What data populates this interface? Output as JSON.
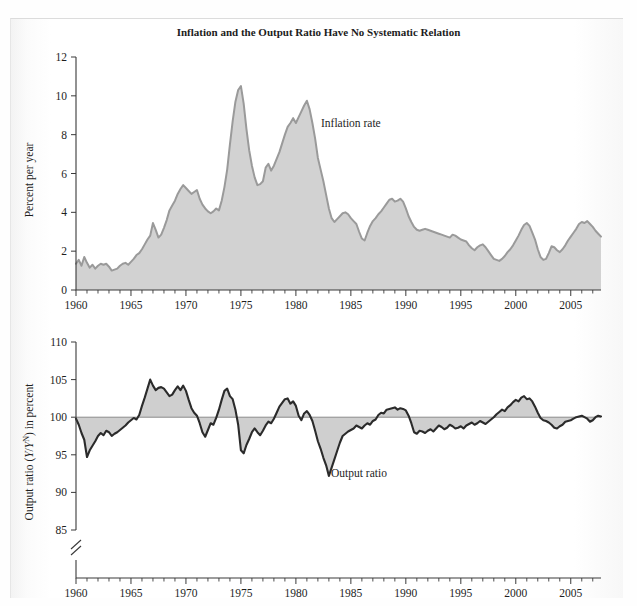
{
  "figure": {
    "title": "Inflation and the Output Ratio Have No Systematic Relation",
    "background_color": "#ffffff",
    "fill_color": "#d2d2d2",
    "inflation_line_color": "#9a9a9a",
    "output_line_color": "#2b2b2b"
  },
  "labels": {
    "inflation_annotation": "Inflation rate",
    "output_annotation": "Output ratio",
    "top_ylabel": "Percent per year",
    "bottom_ylabel_pre": "Output ratio (",
    "bottom_ylabel_y1": "Y",
    "bottom_ylabel_slash": "/",
    "bottom_ylabel_y2": "Y",
    "bottom_ylabel_sup": "N",
    "bottom_ylabel_post": ") in percent"
  },
  "axes": {
    "x_tick_labels": [
      "1960",
      "1965",
      "1970",
      "1975",
      "1980",
      "1985",
      "1990",
      "1995",
      "2000",
      "2005"
    ],
    "x_tick_values": [
      1960,
      1965,
      1970,
      1975,
      1980,
      1985,
      1990,
      1995,
      2000,
      2005
    ],
    "x_min": 1960,
    "x_max": 2007.75,
    "x_minor_step": 1,
    "top_y_tick_labels": [
      "0",
      "2",
      "4",
      "6",
      "8",
      "10",
      "12"
    ],
    "top_y_tick_values": [
      0,
      2,
      4,
      6,
      8,
      10,
      12
    ],
    "top_y_min": 0,
    "top_y_max": 12,
    "bottom_y_tick_labels": [
      "85",
      "90",
      "95",
      "100",
      "105",
      "110"
    ],
    "bottom_y_tick_values": [
      85,
      90,
      95,
      100,
      105,
      110
    ],
    "bottom_y_min": 85,
    "bottom_y_max": 110,
    "bottom_axis_break": true,
    "grid": false,
    "legend": "inline annotations"
  },
  "chart_data": [
    {
      "type": "area",
      "id": "inflation-rate",
      "title": "Inflation and the Output Ratio Have No Systematic Relation",
      "name": "Inflation rate",
      "xlabel": "",
      "ylabel": "Percent per year",
      "xlim": [
        1960,
        2007.75
      ],
      "ylim": [
        0,
        12
      ],
      "grid": false,
      "units": "percent per year",
      "x": [
        1960.0,
        1960.25,
        1960.5,
        1960.75,
        1961.0,
        1961.25,
        1961.5,
        1961.75,
        1962.0,
        1962.25,
        1962.5,
        1962.75,
        1963.0,
        1963.25,
        1963.5,
        1963.75,
        1964.0,
        1964.25,
        1964.5,
        1964.75,
        1965.0,
        1965.25,
        1965.5,
        1965.75,
        1966.0,
        1966.25,
        1966.5,
        1966.75,
        1967.0,
        1967.25,
        1967.5,
        1967.75,
        1968.0,
        1968.25,
        1968.5,
        1968.75,
        1969.0,
        1969.25,
        1969.5,
        1969.75,
        1970.0,
        1970.25,
        1970.5,
        1970.75,
        1971.0,
        1971.25,
        1971.5,
        1971.75,
        1972.0,
        1972.25,
        1972.5,
        1972.75,
        1973.0,
        1973.25,
        1973.5,
        1973.75,
        1974.0,
        1974.25,
        1974.5,
        1974.75,
        1975.0,
        1975.25,
        1975.5,
        1975.75,
        1976.0,
        1976.25,
        1976.5,
        1976.75,
        1977.0,
        1977.25,
        1977.5,
        1977.75,
        1978.0,
        1978.25,
        1978.5,
        1978.75,
        1979.0,
        1979.25,
        1979.5,
        1979.75,
        1980.0,
        1980.25,
        1980.5,
        1980.75,
        1981.0,
        1981.25,
        1981.5,
        1981.75,
        1982.0,
        1982.25,
        1982.5,
        1982.75,
        1983.0,
        1983.25,
        1983.5,
        1983.75,
        1984.0,
        1984.25,
        1984.5,
        1984.75,
        1985.0,
        1985.25,
        1985.5,
        1985.75,
        1986.0,
        1986.25,
        1986.5,
        1986.75,
        1987.0,
        1987.25,
        1987.5,
        1987.75,
        1988.0,
        1988.25,
        1988.5,
        1988.75,
        1989.0,
        1989.25,
        1989.5,
        1989.75,
        1990.0,
        1990.25,
        1990.5,
        1990.75,
        1991.0,
        1991.25,
        1991.5,
        1991.75,
        1992.0,
        1992.25,
        1992.5,
        1992.75,
        1993.0,
        1993.25,
        1993.5,
        1993.75,
        1994.0,
        1994.25,
        1994.5,
        1994.75,
        1995.0,
        1995.25,
        1995.5,
        1995.75,
        1996.0,
        1996.25,
        1996.5,
        1996.75,
        1997.0,
        1997.25,
        1997.5,
        1997.75,
        1998.0,
        1998.25,
        1998.5,
        1998.75,
        1999.0,
        1999.25,
        1999.5,
        1999.75,
        2000.0,
        2000.25,
        2000.5,
        2000.75,
        2001.0,
        2001.25,
        2001.5,
        2001.75,
        2002.0,
        2002.25,
        2002.5,
        2002.75,
        2003.0,
        2003.25,
        2003.5,
        2003.75,
        2004.0,
        2004.25,
        2004.5,
        2004.75,
        2005.0,
        2005.25,
        2005.5,
        2005.75,
        2006.0,
        2006.25,
        2006.5,
        2006.75,
        2007.0,
        2007.25,
        2007.5,
        2007.75
      ],
      "values": [
        1.35,
        1.55,
        1.25,
        1.7,
        1.4,
        1.15,
        1.3,
        1.1,
        1.25,
        1.35,
        1.3,
        1.35,
        1.2,
        1.0,
        1.05,
        1.1,
        1.25,
        1.35,
        1.4,
        1.3,
        1.45,
        1.6,
        1.8,
        1.9,
        2.1,
        2.35,
        2.6,
        2.8,
        3.45,
        3.1,
        2.7,
        2.85,
        3.2,
        3.6,
        4.1,
        4.35,
        4.6,
        4.95,
        5.2,
        5.4,
        5.25,
        5.1,
        4.95,
        5.05,
        5.15,
        4.7,
        4.4,
        4.2,
        4.05,
        3.95,
        4.05,
        4.2,
        4.1,
        4.6,
        5.3,
        6.2,
        7.5,
        8.7,
        9.7,
        10.3,
        10.5,
        9.6,
        8.3,
        7.2,
        6.4,
        5.8,
        5.4,
        5.45,
        5.6,
        6.3,
        6.5,
        6.15,
        6.4,
        6.75,
        7.1,
        7.55,
        8.0,
        8.4,
        8.6,
        8.85,
        8.6,
        8.9,
        9.2,
        9.5,
        9.75,
        9.3,
        8.6,
        7.8,
        6.8,
        6.2,
        5.6,
        4.9,
        4.2,
        3.7,
        3.5,
        3.65,
        3.8,
        3.95,
        4.0,
        3.9,
        3.7,
        3.55,
        3.4,
        3.0,
        2.65,
        2.55,
        2.95,
        3.3,
        3.55,
        3.7,
        3.9,
        4.05,
        4.25,
        4.45,
        4.65,
        4.7,
        4.55,
        4.6,
        4.7,
        4.55,
        4.2,
        3.8,
        3.5,
        3.25,
        3.1,
        3.05,
        3.1,
        3.15,
        3.1,
        3.05,
        3.0,
        2.95,
        2.9,
        2.85,
        2.8,
        2.75,
        2.7,
        2.85,
        2.8,
        2.7,
        2.6,
        2.55,
        2.5,
        2.3,
        2.15,
        2.05,
        2.2,
        2.3,
        2.35,
        2.2,
        2.0,
        1.8,
        1.6,
        1.55,
        1.5,
        1.6,
        1.75,
        1.95,
        2.1,
        2.3,
        2.55,
        2.8,
        3.1,
        3.35,
        3.45,
        3.3,
        2.95,
        2.6,
        2.1,
        1.7,
        1.55,
        1.6,
        1.9,
        2.25,
        2.2,
        2.05,
        1.95,
        2.1,
        2.3,
        2.55,
        2.75,
        2.95,
        3.15,
        3.4,
        3.5,
        3.45,
        3.55,
        3.4,
        3.25,
        3.05,
        2.9,
        2.75,
        2.85
      ]
    },
    {
      "type": "area",
      "id": "output-ratio",
      "name": "Output ratio",
      "xlabel": "",
      "ylabel": "Output ratio (Y/Y^N) in percent",
      "xlim": [
        1960,
        2007.75
      ],
      "ylim": [
        85,
        110
      ],
      "baseline": 100,
      "grid": false,
      "units": "percent of potential output",
      "x": [
        1960.0,
        1960.25,
        1960.5,
        1960.75,
        1961.0,
        1961.25,
        1961.5,
        1961.75,
        1962.0,
        1962.25,
        1962.5,
        1962.75,
        1963.0,
        1963.25,
        1963.5,
        1963.75,
        1964.0,
        1964.25,
        1964.5,
        1964.75,
        1965.0,
        1965.25,
        1965.5,
        1965.75,
        1966.0,
        1966.25,
        1966.5,
        1966.75,
        1967.0,
        1967.25,
        1967.5,
        1967.75,
        1968.0,
        1968.25,
        1968.5,
        1968.75,
        1969.0,
        1969.25,
        1969.5,
        1969.75,
        1970.0,
        1970.25,
        1970.5,
        1970.75,
        1971.0,
        1971.25,
        1971.5,
        1971.75,
        1972.0,
        1972.25,
        1972.5,
        1972.75,
        1973.0,
        1973.25,
        1973.5,
        1973.75,
        1974.0,
        1974.25,
        1974.5,
        1974.75,
        1975.0,
        1975.25,
        1975.5,
        1975.75,
        1976.0,
        1976.25,
        1976.5,
        1976.75,
        1977.0,
        1977.25,
        1977.5,
        1977.75,
        1978.0,
        1978.25,
        1978.5,
        1978.75,
        1979.0,
        1979.25,
        1979.5,
        1979.75,
        1980.0,
        1980.25,
        1980.5,
        1980.75,
        1981.0,
        1981.25,
        1981.5,
        1981.75,
        1982.0,
        1982.25,
        1982.5,
        1982.75,
        1983.0,
        1983.25,
        1983.5,
        1983.75,
        1984.0,
        1984.25,
        1984.5,
        1984.75,
        1985.0,
        1985.25,
        1985.5,
        1985.75,
        1986.0,
        1986.25,
        1986.5,
        1986.75,
        1987.0,
        1987.25,
        1987.5,
        1987.75,
        1988.0,
        1988.25,
        1988.5,
        1988.75,
        1989.0,
        1989.25,
        1989.5,
        1989.75,
        1990.0,
        1990.25,
        1990.5,
        1990.75,
        1991.0,
        1991.25,
        1991.5,
        1991.75,
        1992.0,
        1992.25,
        1992.5,
        1992.75,
        1993.0,
        1993.25,
        1993.5,
        1993.75,
        1994.0,
        1994.25,
        1994.5,
        1994.75,
        1995.0,
        1995.25,
        1995.5,
        1995.75,
        1996.0,
        1996.25,
        1996.5,
        1996.75,
        1997.0,
        1997.25,
        1997.5,
        1997.75,
        1998.0,
        1998.25,
        1998.5,
        1998.75,
        1999.0,
        1999.25,
        1999.5,
        1999.75,
        2000.0,
        2000.25,
        2000.5,
        2000.75,
        2001.0,
        2001.25,
        2001.5,
        2001.75,
        2002.0,
        2002.25,
        2002.5,
        2002.75,
        2003.0,
        2003.25,
        2003.5,
        2003.75,
        2004.0,
        2004.25,
        2004.5,
        2004.75,
        2005.0,
        2005.25,
        2005.5,
        2005.75,
        2006.0,
        2006.25,
        2006.5,
        2006.75,
        2007.0,
        2007.25,
        2007.5,
        2007.75
      ],
      "values": [
        99.8,
        99.0,
        97.9,
        97.0,
        94.7,
        95.6,
        96.2,
        96.8,
        97.5,
        97.9,
        97.6,
        98.2,
        98.0,
        97.5,
        97.8,
        98.0,
        98.3,
        98.6,
        98.9,
        99.3,
        99.6,
        99.9,
        99.7,
        100.3,
        101.5,
        102.6,
        103.8,
        105.0,
        104.2,
        103.6,
        103.9,
        104.0,
        103.8,
        103.3,
        102.8,
        103.0,
        103.6,
        104.1,
        103.6,
        104.2,
        103.5,
        102.3,
        101.2,
        100.6,
        100.2,
        99.2,
        98.0,
        97.4,
        98.3,
        99.2,
        99.0,
        99.9,
        101.0,
        102.3,
        103.5,
        103.8,
        102.8,
        102.4,
        101.0,
        99.0,
        95.6,
        95.2,
        96.3,
        97.1,
        98.0,
        98.5,
        98.0,
        97.6,
        98.2,
        98.9,
        99.4,
        99.2,
        99.8,
        100.6,
        101.4,
        101.9,
        102.4,
        102.5,
        101.8,
        102.1,
        101.5,
        100.2,
        99.6,
        100.5,
        100.8,
        100.3,
        99.5,
        98.2,
        96.8,
        95.8,
        94.6,
        93.6,
        92.2,
        93.3,
        94.4,
        95.5,
        96.6,
        97.5,
        97.8,
        98.1,
        98.3,
        98.5,
        98.9,
        98.7,
        98.5,
        98.9,
        99.2,
        99.0,
        99.5,
        99.7,
        100.3,
        100.6,
        100.5,
        101.0,
        101.1,
        101.2,
        101.3,
        101.0,
        101.2,
        101.1,
        100.9,
        100.2,
        99.2,
        98.0,
        97.8,
        98.2,
        98.1,
        97.9,
        98.2,
        98.4,
        98.1,
        98.5,
        98.9,
        98.7,
        98.4,
        98.6,
        99.0,
        98.8,
        98.5,
        98.6,
        98.8,
        98.5,
        98.9,
        99.1,
        99.3,
        99.0,
        99.2,
        99.5,
        99.3,
        99.1,
        99.4,
        99.7,
        100.0,
        100.4,
        100.7,
        101.0,
        100.8,
        101.3,
        101.6,
        102.0,
        102.3,
        102.1,
        102.6,
        102.8,
        102.4,
        102.5,
        102.1,
        101.4,
        100.6,
        99.9,
        99.6,
        99.5,
        99.3,
        99.0,
        98.6,
        98.5,
        98.8,
        99.0,
        99.4,
        99.5,
        99.6,
        99.8,
        100.0,
        100.1,
        100.2,
        100.0,
        99.8,
        99.4,
        99.6,
        100.0,
        100.2,
        100.1,
        100.3
      ]
    }
  ]
}
